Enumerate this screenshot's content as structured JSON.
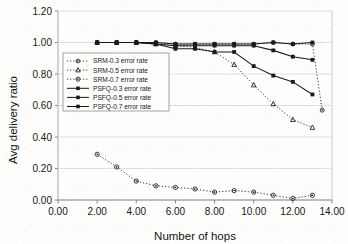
{
  "figure": {
    "background_color": "#fdfdfc",
    "axis_color": "#b8b8b8",
    "grid_color": "#d9d9d9",
    "ink_color": "#1a1a1a"
  },
  "chart_data": {
    "type": "line",
    "title": "",
    "xlabel": "Number of hops",
    "ylabel": "Avg delivery ratio",
    "xlim": [
      0.0,
      14.0
    ],
    "ylim": [
      0.0,
      1.2
    ],
    "xticks": [
      "0.00",
      "2.00",
      "4.00",
      "6.00",
      "8.00",
      "10.00",
      "12.00",
      "14.00"
    ],
    "xtick_values": [
      0,
      2,
      4,
      6,
      8,
      10,
      12,
      14
    ],
    "yticks": [
      "0.00",
      "0.20",
      "0.40",
      "0.60",
      "0.80",
      "1.00",
      "1.20"
    ],
    "ytick_values": [
      0.0,
      0.2,
      0.4,
      0.6,
      0.8,
      1.0,
      1.2
    ],
    "grid": true,
    "grid_axis": "y",
    "legend_position": "center-left inside plot",
    "series": [
      {
        "name": "SRM-0.3 error rate",
        "marker": "circle-open",
        "line_style": "dotted",
        "x": [
          2,
          3,
          4,
          5,
          6,
          7,
          8,
          9,
          10,
          11,
          12,
          13,
          13.5
        ],
        "values": [
          1.0,
          1.0,
          1.0,
          1.0,
          0.99,
          0.99,
          0.99,
          0.99,
          0.99,
          1.0,
          0.99,
          0.99,
          0.57
        ]
      },
      {
        "name": "SRM-0.5 error rate",
        "marker": "triangle-open",
        "line_style": "dotted",
        "x": [
          2,
          3,
          4,
          5,
          6,
          7,
          8,
          9,
          10,
          11,
          12,
          13
        ],
        "values": [
          1.0,
          1.0,
          1.0,
          0.99,
          0.98,
          0.97,
          0.94,
          0.86,
          0.73,
          0.61,
          0.51,
          0.46
        ]
      },
      {
        "name": "SRM-0.7 error rate",
        "marker": "circle-dot",
        "line_style": "dotted",
        "x": [
          2,
          3,
          4,
          5,
          6,
          7,
          8,
          9,
          10,
          11,
          12,
          13
        ],
        "values": [
          0.29,
          0.21,
          0.12,
          0.09,
          0.08,
          0.07,
          0.05,
          0.06,
          0.05,
          0.03,
          0.01,
          0.03
        ]
      },
      {
        "name": "PSFQ-0.3 error rate",
        "marker": "square-filled",
        "line_style": "solid",
        "x": [
          2,
          3,
          4,
          5,
          6,
          7,
          8,
          9,
          10,
          11,
          12,
          13
        ],
        "values": [
          1.0,
          1.0,
          1.0,
          1.0,
          0.99,
          0.99,
          0.99,
          0.99,
          0.99,
          1.0,
          0.99,
          1.0
        ]
      },
      {
        "name": "PSFQ-0.5 error rate",
        "marker": "square-filled",
        "line_style": "solid",
        "x": [
          2,
          3,
          4,
          5,
          6,
          7,
          8,
          9,
          10,
          11,
          12,
          13
        ],
        "values": [
          1.0,
          1.0,
          1.0,
          0.99,
          0.98,
          0.98,
          0.98,
          0.98,
          0.98,
          0.95,
          0.91,
          0.89
        ]
      },
      {
        "name": "PSFQ-0.7 error rate",
        "marker": "square-filled",
        "line_style": "solid",
        "x": [
          2,
          3,
          4,
          5,
          6,
          7,
          8,
          9,
          10,
          11,
          12,
          13
        ],
        "values": [
          1.0,
          1.0,
          1.0,
          0.99,
          0.96,
          0.96,
          0.94,
          0.94,
          0.85,
          0.79,
          0.75,
          0.67
        ]
      }
    ]
  },
  "legend": {
    "entries": [
      {
        "label": "SRM-0.3 error rate"
      },
      {
        "label": "SRM-0.5 error rate"
      },
      {
        "label": "SRM-0.7 error rate"
      },
      {
        "label": "PSFQ-0.3 error rate"
      },
      {
        "label": "PSFQ-0.5 error rate"
      },
      {
        "label": "PSFQ-0.7 error rate"
      }
    ]
  }
}
